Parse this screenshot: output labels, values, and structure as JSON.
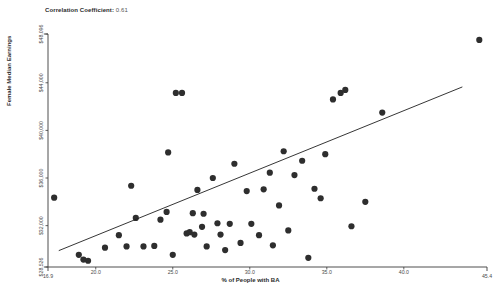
{
  "chart_data": {
    "type": "scatter",
    "title": "Correlation Coefficient: 0.61",
    "title_label": "Correlation Coefficient:",
    "title_value": "0.61",
    "correlation_coefficient": 0.61,
    "xlabel": "% of People with BA",
    "ylabel": "Female Median Earnings",
    "xlim": [
      16.9,
      45.4
    ],
    "ylim": [
      28526,
      48096
    ],
    "grid": false,
    "legend": "none",
    "x_ticks": [
      16.9,
      20.0,
      25.0,
      30.0,
      35.0,
      40.0,
      45.4
    ],
    "x_tick_labels": [
      "16.9",
      "20.0",
      "25.0",
      "30.0",
      "35.0",
      "40.0",
      "45.4"
    ],
    "y_ticks": [
      28526,
      32000,
      36000,
      40000,
      44000,
      48096
    ],
    "y_tick_labels": [
      "$28,526",
      "$32,000",
      "$36,000",
      "$40,000",
      "$44,000",
      "$48,096"
    ],
    "point_color": "#2e2e2e",
    "trendline_color": "#1f1f1f",
    "axis_color": "#3a3a3a",
    "trendline": {
      "x_start": 17.6,
      "y_start": 29900,
      "x_end": 43.8,
      "y_end": 43650
    },
    "points": [
      {
        "x": 17.3,
        "y": 34350
      },
      {
        "x": 18.9,
        "y": 29550
      },
      {
        "x": 19.2,
        "y": 29150
      },
      {
        "x": 19.5,
        "y": 29050
      },
      {
        "x": 20.6,
        "y": 30150
      },
      {
        "x": 21.5,
        "y": 31200
      },
      {
        "x": 22.0,
        "y": 30250
      },
      {
        "x": 22.3,
        "y": 35350
      },
      {
        "x": 22.6,
        "y": 32650
      },
      {
        "x": 23.1,
        "y": 30250
      },
      {
        "x": 23.8,
        "y": 30300
      },
      {
        "x": 24.2,
        "y": 32500
      },
      {
        "x": 24.6,
        "y": 33150
      },
      {
        "x": 24.7,
        "y": 38150
      },
      {
        "x": 25.0,
        "y": 29550
      },
      {
        "x": 25.2,
        "y": 43150
      },
      {
        "x": 25.6,
        "y": 43150
      },
      {
        "x": 25.9,
        "y": 31350
      },
      {
        "x": 26.1,
        "y": 31450
      },
      {
        "x": 26.3,
        "y": 33050
      },
      {
        "x": 26.4,
        "y": 31250
      },
      {
        "x": 26.6,
        "y": 35000
      },
      {
        "x": 26.9,
        "y": 31900
      },
      {
        "x": 27.0,
        "y": 33000
      },
      {
        "x": 27.2,
        "y": 30250
      },
      {
        "x": 27.6,
        "y": 36000
      },
      {
        "x": 27.9,
        "y": 32200
      },
      {
        "x": 28.1,
        "y": 31250
      },
      {
        "x": 28.4,
        "y": 29950
      },
      {
        "x": 28.7,
        "y": 32150
      },
      {
        "x": 29.0,
        "y": 37200
      },
      {
        "x": 29.4,
        "y": 30550
      },
      {
        "x": 29.8,
        "y": 34900
      },
      {
        "x": 30.1,
        "y": 32150
      },
      {
        "x": 30.6,
        "y": 31200
      },
      {
        "x": 30.9,
        "y": 35050
      },
      {
        "x": 31.3,
        "y": 36450
      },
      {
        "x": 31.5,
        "y": 30350
      },
      {
        "x": 31.9,
        "y": 33700
      },
      {
        "x": 32.2,
        "y": 38250
      },
      {
        "x": 32.5,
        "y": 31600
      },
      {
        "x": 32.9,
        "y": 36250
      },
      {
        "x": 33.4,
        "y": 37450
      },
      {
        "x": 33.8,
        "y": 29300
      },
      {
        "x": 34.2,
        "y": 35100
      },
      {
        "x": 34.6,
        "y": 34300
      },
      {
        "x": 34.9,
        "y": 38000
      },
      {
        "x": 35.4,
        "y": 42600
      },
      {
        "x": 35.9,
        "y": 43150
      },
      {
        "x": 36.2,
        "y": 43400
      },
      {
        "x": 36.6,
        "y": 31950
      },
      {
        "x": 37.5,
        "y": 34000
      },
      {
        "x": 38.6,
        "y": 41500
      },
      {
        "x": 44.9,
        "y": 47600
      }
    ]
  }
}
